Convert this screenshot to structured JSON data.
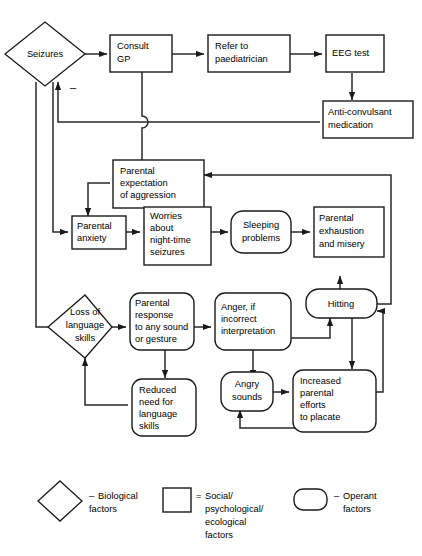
{
  "diagram": {
    "nodes": {
      "seizures": {
        "label": "Seizures",
        "shape": "diamond",
        "category": "biological"
      },
      "consult_gp": {
        "label_line1": "Consult",
        "label_line2": "GP",
        "shape": "rectangle",
        "category": "social"
      },
      "refer_paediatrician": {
        "label_line1": "Refer to",
        "label_line2": "paediatrician",
        "shape": "rectangle",
        "category": "social"
      },
      "eeg_test": {
        "label_line1": "EEG test",
        "shape": "rectangle",
        "category": "social"
      },
      "anticonvulsant": {
        "label_line1": "Anti-convulsant",
        "label_line2": "medication",
        "shape": "rectangle",
        "category": "social"
      },
      "parental_expectation": {
        "label_line1": "Parental",
        "label_line2": "expectation",
        "label_line3": "of aggression",
        "shape": "rectangle",
        "category": "social"
      },
      "parental_anxiety": {
        "label_line1": "Parental",
        "label_line2": "anxiety",
        "shape": "rectangle",
        "category": "social"
      },
      "worries": {
        "label_line1": "Worries",
        "label_line2": "about",
        "label_line3": "night-time",
        "label_line4": "seizures",
        "shape": "rectangle",
        "category": "social"
      },
      "sleeping_problems": {
        "label_line1": "Sleeping",
        "label_line2": "problems",
        "shape": "rounded",
        "category": "operant"
      },
      "parental_exhaustion": {
        "label_line1": "Parental",
        "label_line2": "exhaustion",
        "label_line3": "and misery",
        "shape": "rectangle",
        "category": "social"
      },
      "loss_language": {
        "label_line1": "Loss of",
        "label_line2": "language",
        "label_line3": "skills",
        "shape": "diamond",
        "category": "biological"
      },
      "parental_response": {
        "label_line1": "Parental",
        "label_line2": "response",
        "label_line3": "to any sound",
        "label_line4": "or gesture",
        "shape": "rounded",
        "category": "operant"
      },
      "anger": {
        "label_line1": "Anger, if",
        "label_line2": "incorrect",
        "label_line3": "interpretation",
        "shape": "rounded",
        "category": "operant"
      },
      "hitting": {
        "label_line1": "Hitting",
        "shape": "rounded",
        "category": "operant"
      },
      "reduced_need": {
        "label_line1": "Reduced",
        "label_line2": "need for",
        "label_line3": "language",
        "label_line4": "skills",
        "shape": "rounded",
        "category": "operant"
      },
      "angry_sounds": {
        "label_line1": "Angry",
        "label_line2": "sounds",
        "shape": "rounded",
        "category": "operant"
      },
      "increased_efforts": {
        "label_line1": "Increased",
        "label_line2": "parental",
        "label_line3": "efforts",
        "label_line4": "to placate",
        "shape": "rounded",
        "category": "operant"
      }
    },
    "annotations": {
      "negative_sign": "–"
    }
  },
  "legend": {
    "items": [
      {
        "shape": "diamond",
        "connector": "–",
        "label_line1": "Biological",
        "label_line2": "factors"
      },
      {
        "shape": "rectangle",
        "connector": "=",
        "label_line1": "Social/",
        "label_line2": "psychological/",
        "label_line3": "ecological",
        "label_line4": "factors"
      },
      {
        "shape": "rounded",
        "connector": "–",
        "label_line1": "Operant",
        "label_line2": "factors"
      }
    ]
  },
  "colors": {
    "stroke": "#1a1a1a",
    "fill": "#ffffff",
    "edge": "#2a2a2a"
  }
}
